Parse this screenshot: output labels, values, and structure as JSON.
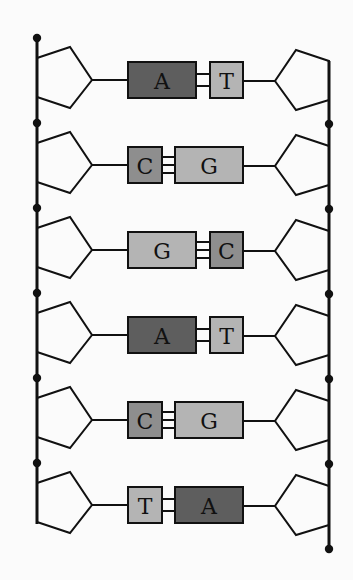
{
  "diagram": {
    "colors": {
      "A": "#5e5e5e",
      "T": "#b4b4b4",
      "C": "#8e8e8e",
      "G": "#b4b4b4",
      "stroke": "#111111",
      "background": "#fbfbfb"
    },
    "base_pairs": [
      {
        "left": "A",
        "right": "T",
        "bonds": 2
      },
      {
        "left": "C",
        "right": "G",
        "bonds": 3
      },
      {
        "left": "G",
        "right": "C",
        "bonds": 3
      },
      {
        "left": "A",
        "right": "T",
        "bonds": 2
      },
      {
        "left": "C",
        "right": "G",
        "bonds": 3
      },
      {
        "left": "T",
        "right": "A",
        "bonds": 2
      }
    ]
  }
}
